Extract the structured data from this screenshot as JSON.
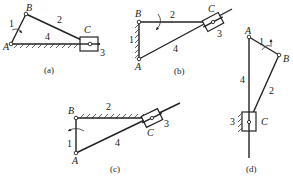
{
  "figure": {
    "panels": [
      {
        "id": "a",
        "caption": "(a)",
        "joints": {
          "A": "A",
          "B": "B",
          "C": "C"
        },
        "links": {
          "l1": "1",
          "l2": "2",
          "l3": "3",
          "l4": "4"
        },
        "description": "Crank-slider: crank 1 (A-B) rotating about A, coupler 2 (B-C), slider 3 at C on horizontal frame 4"
      },
      {
        "id": "b",
        "caption": "(b)",
        "joints": {
          "A": "A",
          "B": "B",
          "C": "C"
        },
        "links": {
          "l1": "1",
          "l2": "2",
          "l3": "3",
          "l4": "4"
        },
        "description": "Inversion: link 1 (A-B) fixed, link 2 rotates about B, slider 3 on guide link 4 pivoting at A"
      },
      {
        "id": "c",
        "caption": "(c)",
        "joints": {
          "A": "A",
          "B": "B",
          "C": "C"
        },
        "links": {
          "l1": "1",
          "l2": "2",
          "l3": "3",
          "l4": "4"
        },
        "description": "Inversion: link 2 (B-C) fixed, link 1 rotates about B, slider 3 on link 4 pivoting at A"
      },
      {
        "id": "d",
        "caption": "(d)",
        "joints": {
          "A": "A",
          "B": "B",
          "C": "C"
        },
        "links": {
          "l1": "1",
          "l2": "2",
          "l3": "3",
          "l4": "4"
        },
        "description": "Inversion: slider 3 fixed, link 4 vertical through A and C, crank 1 A-B, coupler 2 B-C"
      }
    ]
  }
}
